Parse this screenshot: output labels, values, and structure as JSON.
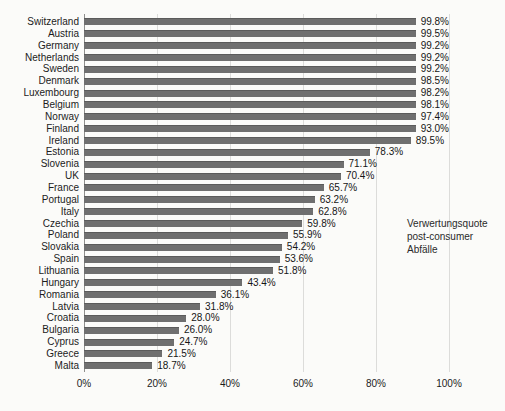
{
  "chart_data": {
    "type": "bar",
    "orientation": "horizontal",
    "title": "",
    "xlabel": "",
    "ylabel": "",
    "xlim": [
      0,
      100
    ],
    "grid": true,
    "bar_color": "#6f6f6f",
    "categories": [
      "Switzerland",
      "Austria",
      "Germany",
      "Netherlands",
      "Sweden",
      "Denmark",
      "Luxembourg",
      "Belgium",
      "Norway",
      "Finland",
      "Ireland",
      "Estonia",
      "Slovenia",
      "UK",
      "France",
      "Portugal",
      "Italy",
      "Czechia",
      "Poland",
      "Slovakia",
      "Spain",
      "Lithuania",
      "Hungary",
      "Romania",
      "Latvia",
      "Croatia",
      "Bulgaria",
      "Cyprus",
      "Greece",
      "Malta"
    ],
    "values": [
      99.8,
      99.5,
      99.2,
      99.2,
      99.2,
      98.5,
      98.2,
      98.1,
      97.4,
      93.0,
      89.5,
      78.3,
      71.1,
      70.4,
      65.7,
      63.2,
      62.8,
      59.8,
      55.9,
      54.2,
      53.6,
      51.8,
      43.4,
      36.1,
      31.8,
      28.0,
      26.0,
      24.7,
      21.5,
      18.7
    ],
    "value_labels": [
      "99.8%",
      "99.5%",
      "99.2%",
      "99.2%",
      "99.2%",
      "98.5%",
      "98.2%",
      "98.1%",
      "97.4%",
      "93.0%",
      "89.5%",
      "78.3%",
      "71.1%",
      "70.4%",
      "65.7%",
      "63.2%",
      "62.8%",
      "59.8%",
      "55.9%",
      "54.2%",
      "53.6%",
      "51.8%",
      "43.4%",
      "36.1%",
      "31.8%",
      "28.0%",
      "26.0%",
      "24.7%",
      "21.5%",
      "18.7%"
    ],
    "x_ticks": [
      "0%",
      "20%",
      "40%",
      "60%",
      "80%",
      "100%"
    ],
    "annotation": {
      "lines": [
        "Verwertungsquote",
        "post-consumer",
        "Abfälle"
      ]
    }
  }
}
